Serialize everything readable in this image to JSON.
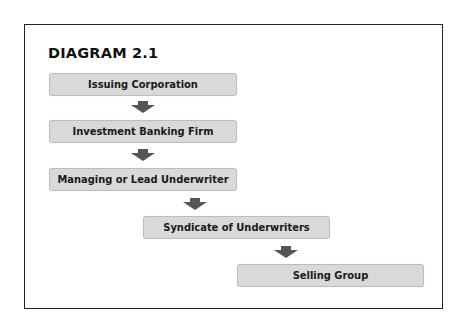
{
  "diagram": {
    "title": "DIAGRAM 2.1",
    "steps": [
      {
        "label": "Issuing Corporation"
      },
      {
        "label": "Investment Banking Firm"
      },
      {
        "label": "Managing or Lead Underwriter"
      },
      {
        "label": "Syndicate of Underwriters"
      },
      {
        "label": "Selling Group"
      }
    ],
    "colors": {
      "box_fill": "#d9d9d9",
      "box_border": "#bcbcbc",
      "arrow": "#555555",
      "frame": "#222222"
    }
  }
}
